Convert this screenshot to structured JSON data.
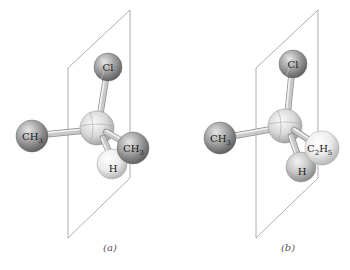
{
  "figure": {
    "panels": [
      {
        "id": "a",
        "caption": "(a)",
        "atoms": {
          "top": "Cl",
          "left": {
            "main": "CH",
            "sub": "3"
          },
          "right": {
            "main": "CH",
            "sub": "3"
          },
          "front": "H"
        }
      },
      {
        "id": "b",
        "caption": "(b)",
        "atoms": {
          "top": "Cl",
          "left": {
            "main": "CH",
            "sub": "3"
          },
          "right": {
            "main": "C",
            "sub": "2",
            "main2": "H",
            "sub2": "5"
          },
          "front": "H"
        }
      }
    ]
  },
  "colors": {
    "dark_atom": "#8c8c8c",
    "light_atom": "#e8e8e8",
    "center_atom": "#d6d6d6",
    "plane_line": "#9a9a9a"
  }
}
